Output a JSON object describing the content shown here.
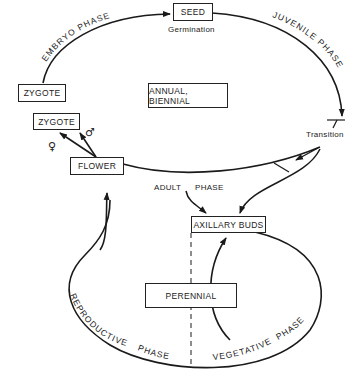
{
  "diagram": {
    "nodes": {
      "seed": "SEED",
      "zygote_top": "ZYGOTE",
      "zygote_small": "ZYGOTE",
      "flower": "FLOWER",
      "annual_biennial": "ANNUAL, BIENNIAL",
      "axillary_buds": "AXILLARY BUDS",
      "perennial": "PERENNIAL"
    },
    "labels": {
      "germination": "Germination",
      "transition": "Transition",
      "adult": "ADULT",
      "phase": "PHASE",
      "female_symbol": "♀",
      "male_symbol": "♂"
    },
    "phases": {
      "embryo": "EMBRYO PHASE",
      "juvenile": "JUVENILE PHASE",
      "reproductive": "REPRODUCTIVE",
      "reproductive_phase": "PHASE",
      "vegetative": "VEGETATIVE",
      "vegetative_phase": "PHASE"
    },
    "colors": {
      "line": "#1a1a1a",
      "background": "#ffffff"
    }
  }
}
